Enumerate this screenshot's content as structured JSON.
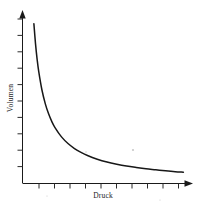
{
  "figure": {
    "background_color": "#ffffff",
    "ink_color": "#171717",
    "style": "scanned-line-drawing"
  },
  "axes": {
    "x": {
      "label": "Druck",
      "arrow": "right-arrowhead",
      "tick_count": 10,
      "ticks_visible": true,
      "tick_labels_visible": false
    },
    "y": {
      "label": "Volumen",
      "arrow": "up-arrowhead",
      "tick_count": 10,
      "ticks_visible": true,
      "tick_labels_visible": false,
      "label_rotation": "-90"
    }
  },
  "chart_data": {
    "type": "line",
    "title": "",
    "subtitle": "",
    "xlabel": "Druck",
    "ylabel": "Volumen",
    "xlim": [
      0,
      10
    ],
    "ylim": [
      0,
      10
    ],
    "grid": false,
    "legend": "none",
    "annotations": [],
    "xtick_labels": [
      "",
      "",
      "",
      "",
      "",
      "",
      "",
      "",
      "",
      ""
    ],
    "ytick_labels": [
      "",
      "",
      "",
      "",
      "",
      "",
      "",
      "",
      "",
      ""
    ],
    "relation": "V = k / p (Boyle-Mariotte)",
    "series": [
      {
        "name": "Volumen(Druck)",
        "x": [
          0.7,
          0.8,
          0.9,
          1.0,
          1.2,
          1.4,
          1.6,
          1.8,
          2.0,
          2.4,
          2.8,
          3.2,
          3.6,
          4.0,
          4.6,
          5.2,
          5.8,
          6.4,
          7.0,
          7.6,
          8.2,
          8.8,
          9.4,
          9.9
        ],
        "y": [
          9.6,
          8.4,
          7.46,
          6.72,
          5.6,
          4.8,
          4.2,
          3.73,
          3.36,
          2.8,
          2.4,
          2.1,
          1.87,
          1.68,
          1.46,
          1.29,
          1.16,
          1.05,
          0.96,
          0.88,
          0.82,
          0.76,
          0.71,
          0.68
        ]
      }
    ]
  }
}
